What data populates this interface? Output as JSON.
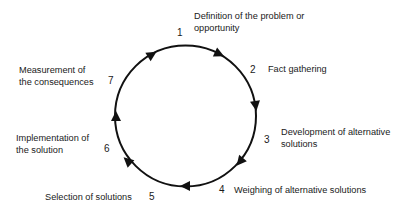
{
  "diagram": {
    "type": "cycle",
    "stroke_color": "#111111",
    "steps": [
      {
        "number": "1",
        "label_line1": "Definition of the problem or",
        "label_line2": "opportunity"
      },
      {
        "number": "2",
        "label_line1": "Fact gathering",
        "label_line2": ""
      },
      {
        "number": "3",
        "label_line1": "Development of alternative",
        "label_line2": "solutions"
      },
      {
        "number": "4",
        "label_line1": "Weighing of alternative solutions",
        "label_line2": ""
      },
      {
        "number": "5",
        "label_line1": "Selection of solutions",
        "label_line2": ""
      },
      {
        "number": "6",
        "label_line1": "Implementation of",
        "label_line2": "the solution"
      },
      {
        "number": "7",
        "label_line1": "Measurement of",
        "label_line2": "the consequences"
      }
    ]
  }
}
